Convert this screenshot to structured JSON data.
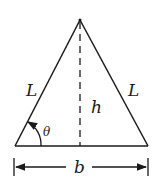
{
  "diagram": {
    "type": "isosceles-triangle",
    "labels": {
      "left_side": "L",
      "right_side": "L",
      "height": "h",
      "angle": "θ",
      "base": "b"
    },
    "colors": {
      "stroke": "#1a1a1a",
      "background": "#ffffff"
    }
  }
}
